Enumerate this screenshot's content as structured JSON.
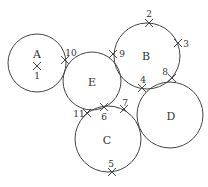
{
  "diagram": {
    "stroke_color": "#444444",
    "circles": [
      {
        "id": "A",
        "label": "A",
        "cx": 37,
        "cy": 63,
        "r": 29,
        "lx": 37,
        "ly": 58
      },
      {
        "id": "B",
        "label": "B",
        "cx": 147,
        "cy": 56,
        "r": 33,
        "lx": 146,
        "ly": 60
      },
      {
        "id": "C",
        "label": "C",
        "cx": 108,
        "cy": 139,
        "r": 33,
        "lx": 107,
        "ly": 144
      },
      {
        "id": "D",
        "label": "D",
        "cx": 170,
        "cy": 115,
        "r": 33,
        "lx": 171,
        "ly": 120
      },
      {
        "id": "E",
        "label": "E",
        "cx": 92,
        "cy": 81,
        "r": 29,
        "lx": 92,
        "ly": 86
      }
    ],
    "points": [
      {
        "label": "1",
        "x": 37,
        "y": 66,
        "lx": 37,
        "ly": 79
      },
      {
        "label": "2",
        "x": 149,
        "y": 23,
        "lx": 149,
        "ly": 17
      },
      {
        "label": "3",
        "x": 178,
        "y": 43,
        "lx": 186,
        "ly": 47
      },
      {
        "label": "4",
        "x": 142,
        "y": 88,
        "lx": 143,
        "ly": 83
      },
      {
        "label": "5",
        "x": 112,
        "y": 172,
        "lx": 111,
        "ly": 167
      },
      {
        "label": "6",
        "x": 104,
        "y": 107,
        "lx": 104,
        "ly": 120
      },
      {
        "label": "7",
        "x": 124,
        "y": 109,
        "lx": 125,
        "ly": 106
      },
      {
        "label": "8",
        "x": 172,
        "y": 78,
        "lx": 165,
        "ly": 75
      },
      {
        "label": "9",
        "x": 113,
        "y": 54,
        "lx": 122,
        "ly": 57
      },
      {
        "label": "10",
        "x": 65,
        "y": 60,
        "lx": 71,
        "ly": 56
      },
      {
        "label": "11",
        "x": 87,
        "y": 113,
        "lx": 79,
        "ly": 117
      }
    ]
  }
}
